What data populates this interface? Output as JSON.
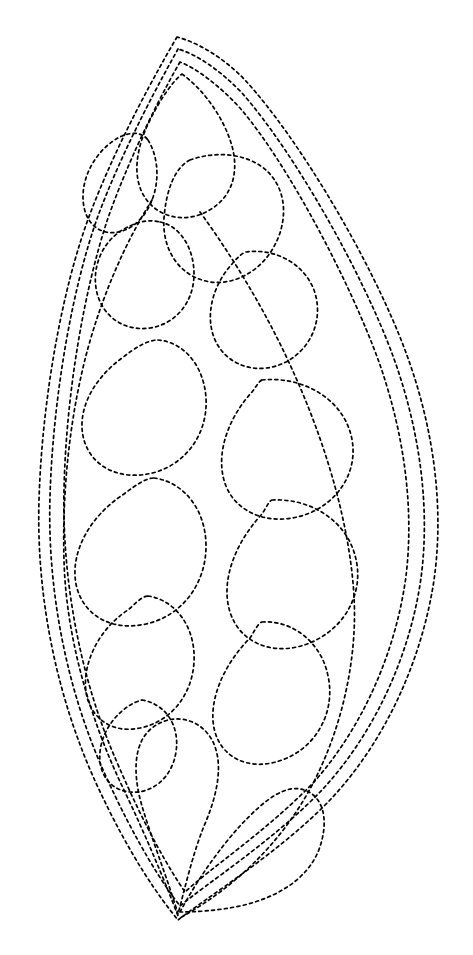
{
  "document": {
    "title": "Feather Leaf Quilting Stencil",
    "kind": "line-art-pattern",
    "background_color": "#ffffff",
    "canvas": {
      "width": 473,
      "height": 955
    }
  },
  "style": {
    "stroke_color": "#000000",
    "stroke_width": 1.7,
    "dash_length": 3,
    "dash_gap": 3.4,
    "line_cap": "round",
    "fill": "none"
  },
  "geometry": {
    "top_apex": {
      "x": 177,
      "y": 37
    },
    "bottom_apex": {
      "x": 178,
      "y": 920
    },
    "left_extent": {
      "x": 38,
      "y": 540
    },
    "right_extent": {
      "x": 438,
      "y": 545
    }
  },
  "shapes": [
    {
      "name": "outer-border-leaf",
      "role": "outer outline of the leaf / feather silhouette",
      "closed": true,
      "d": "M 177 37 C 160 66 118 140 90 214 C 62 288 42 400 39 500 C 36 600 58 700 96 783 C 130 857 160 898 178 920 C 206 898 280 852 330 800 C 385 742 422 660 434 580 C 444 510 435 430 405 350 C 372 262 300 140 245 80 C 222 56 196 42 177 37 Z"
    },
    {
      "name": "inner-border-leaf-1",
      "role": "second nested outline inside the outer border",
      "closed": true,
      "d": "M 178 49 C 163 76 124 146 98 216 C 72 288 53 398 50 496 C 47 594 68 692 104 772 C 136 843 163 884 180 906 C 206 884 274 840 322 790 C 374 734 410 656 421 578 C 430 510 421 433 393 356 C 362 272 294 152 242 93 C 220 70 196 54 178 49 Z"
    },
    {
      "name": "inner-border-leaf-2",
      "role": "third nested outline, the innermost frame of the feather",
      "closed": true,
      "d": "M 180 62 C 166 86 132 150 108 218 C 84 290 66 394 64 490 C 62 586 82 682 116 760 C 146 830 170 870 185 892 C 208 870 268 830 314 782 C 362 728 396 652 406 576 C 414 510 405 436 379 362 C 350 282 288 164 240 108 C 220 86 196 68 180 62 Z"
    },
    {
      "name": "petal-upper-tip",
      "role": "small teardrop at the very top of the inner field",
      "closed": true,
      "d": "M 182 74 C 204 90 224 118 232 146 C 240 176 230 200 206 212 C 182 224 156 216 144 196 C 132 176 136 148 150 120 C 160 100 172 82 182 74 Z"
    },
    {
      "name": "petal-left-1",
      "role": "small rounded petal on the left below the tip",
      "closed": true,
      "d": "M 148 140 C 158 156 160 180 152 200 C 144 222 124 236 106 232 C 88 228 80 208 84 186 C 88 164 104 144 122 136 C 132 132 142 132 148 140 Z"
    },
    {
      "name": "petal-right-upper-large",
      "role": "large rounded petal upper right quadrant",
      "closed": true,
      "d": "M 190 160 C 218 150 250 154 268 172 C 288 192 288 224 272 250 C 256 276 226 288 202 280 C 176 272 162 246 164 218 C 166 192 174 168 190 160 Z"
    },
    {
      "name": "petal-left-2",
      "role": "rounded petal left side, second tier",
      "closed": true,
      "d": "M 160 222 C 180 226 194 248 194 274 C 194 302 176 324 150 328 C 122 332 100 314 96 288 C 92 262 106 236 130 226 C 142 220 152 220 160 222 Z"
    },
    {
      "name": "petal-right-2",
      "role": "rounded petal right side, second tier",
      "closed": true,
      "d": "M 246 252 C 276 248 304 264 314 290 C 324 318 312 348 286 362 C 258 376 228 366 216 342 C 204 318 212 286 232 264 C 237 258 242 253 246 252 Z"
    },
    {
      "name": "petal-left-3",
      "role": "large teardrop left side, third tier",
      "closed": true,
      "d": "M 158 340 C 184 342 204 366 206 398 C 208 432 188 462 156 472 C 122 482 92 468 84 440 C 76 412 92 380 122 358 C 136 347 148 340 158 340 Z"
    },
    {
      "name": "petal-right-3",
      "role": "large teardrop right side, third tier",
      "closed": true,
      "d": "M 262 380 C 300 376 336 396 348 426 C 362 460 346 496 312 512 C 276 528 238 516 226 486 C 214 456 228 418 252 392 C 256 387 259 381 262 380 Z"
    },
    {
      "name": "petal-left-4",
      "role": "large teardrop left side, fourth tier",
      "closed": true,
      "d": "M 154 478 C 184 482 206 510 206 546 C 206 584 182 616 146 624 C 110 632 82 614 76 584 C 70 552 90 516 124 494 C 136 485 146 478 154 478 Z"
    },
    {
      "name": "petal-right-4",
      "role": "large teardrop right side, fourth tier",
      "closed": true,
      "d": "M 272 500 C 310 498 344 520 354 552 C 366 588 348 626 312 642 C 276 658 240 644 230 612 C 220 580 236 542 262 514 C 266 508 269 501 272 500 Z"
    },
    {
      "name": "petal-left-5",
      "role": "teardrop left side, fifth tier, tail curls to lower right",
      "closed": true,
      "d": "M 148 596 C 176 600 196 628 194 662 C 192 696 170 722 140 728 C 112 734 90 718 86 692 C 82 662 100 628 128 610 C 135 604 142 596 148 596 Z"
    },
    {
      "name": "petal-right-5",
      "role": "teardrop right side, fifth tier",
      "closed": true,
      "d": "M 262 622 C 294 620 322 644 328 676 C 336 712 316 748 282 760 C 250 772 220 758 214 728 C 208 698 226 662 250 638 C 254 632 258 623 262 622 Z"
    },
    {
      "name": "petal-left-small-bottom",
      "role": "small teardrop near lower-left, tail pointing to bottom apex",
      "closed": true,
      "d": "M 142 700 C 166 704 180 726 176 752 C 172 778 152 794 130 792 C 110 790 98 774 100 752 C 102 730 118 710 136 702 C 139 701 141 700 142 700 Z"
    },
    {
      "name": "teardrop-bottom-left",
      "role": "bottom-left teardrop with long tail into the bottom apex",
      "closed": true,
      "d": "M 178 914 C 168 880 152 840 142 806 C 132 772 134 742 152 728 C 172 712 200 718 212 740 C 224 762 218 794 204 826 C 192 856 184 892 178 914 Z"
    },
    {
      "name": "teardrop-bottom-right",
      "role": "bottom-right teardrop with long tail into the bottom apex",
      "closed": true,
      "d": "M 180 912 C 196 882 218 850 240 826 C 266 798 286 784 304 790 C 324 796 330 822 318 852 C 306 880 276 898 240 906 C 216 911 194 912 180 912 Z"
    },
    {
      "name": "vein-left-inner",
      "role": "inner spine curve on the left running from top region to bottom apex",
      "closed": false,
      "d": "M 152 200 C 128 238 104 290 88 348 C 70 414 62 490 64 560 C 66 640 92 724 124 790 C 146 836 166 884 178 916"
    },
    {
      "name": "vein-right-inner",
      "role": "inner spine curve on the right running from top region to bottom apex",
      "closed": false,
      "d": "M 200 212 C 232 256 268 314 296 378 C 328 450 350 528 354 596 C 358 666 338 746 300 806 C 262 866 212 900 180 918"
    }
  ]
}
